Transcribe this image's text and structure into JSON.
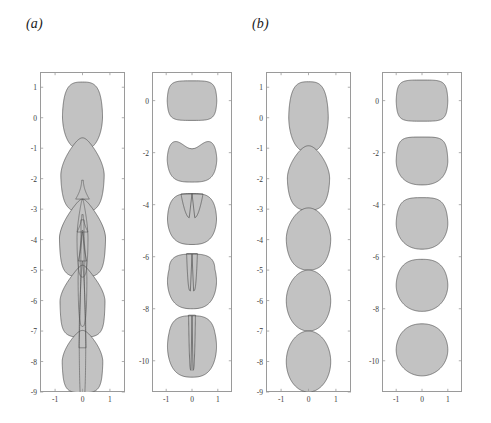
{
  "figure": {
    "background": "#ffffff",
    "shape_fill": "#c2c2c2",
    "shape_stroke": "#4d4d4d",
    "axis_color": "#9a9a9a",
    "tick_label_color": "#3a3a3a"
  },
  "panels": [
    {
      "label": "(a)",
      "subplots": [
        {
          "name": "panel-a-left",
          "xlim": [
            -1.55,
            1.55
          ],
          "ylim": [
            -9.0,
            1.5
          ],
          "xticks": [
            -1,
            0,
            1
          ],
          "xticklabels": [
            "-1",
            "0",
            "1"
          ],
          "yticks": [
            1,
            0,
            -1,
            -2,
            -3,
            -4,
            -5,
            -6,
            -7,
            -8,
            -9
          ],
          "yticklabels": [
            "1",
            "0",
            "-1",
            "-2",
            "-3",
            "-4",
            "-5",
            "-6",
            "-7",
            "-8",
            "-9"
          ],
          "has_interior_contours": true,
          "shape_count": 5
        },
        {
          "name": "panel-a-right",
          "xlim": [
            -1.55,
            1.55
          ],
          "ylim": [
            -11.2,
            1.1
          ],
          "xticks": [
            -1,
            0,
            1
          ],
          "xticklabels": [
            "-1",
            "0",
            "1"
          ],
          "yticks": [
            0,
            -2,
            -4,
            -6,
            -8,
            -10
          ],
          "yticklabels": [
            "0",
            "-2",
            "-4",
            "-6",
            "-8",
            "-10"
          ],
          "has_interior_contours": false,
          "shape_count": 5
        }
      ]
    },
    {
      "label": "(b)",
      "subplots": [
        {
          "name": "panel-b-left",
          "xlim": [
            -1.55,
            1.55
          ],
          "ylim": [
            -9.0,
            1.5
          ],
          "xticks": [
            -1,
            0,
            1
          ],
          "xticklabels": [
            "-1",
            "0",
            "1"
          ],
          "yticks": [
            1,
            0,
            -1,
            -2,
            -3,
            -4,
            -5,
            -6,
            -7,
            -8,
            -9
          ],
          "yticklabels": [
            "1",
            "0",
            "-1",
            "-2",
            "-3",
            "-4",
            "-5",
            "-6",
            "-7",
            "-8",
            "-9"
          ],
          "has_interior_contours": false,
          "shape_count": 5
        },
        {
          "name": "panel-b-right",
          "xlim": [
            -1.55,
            1.55
          ],
          "ylim": [
            -11.2,
            1.1
          ],
          "xticks": [
            -1,
            0,
            1
          ],
          "xticklabels": [
            "-1",
            "0",
            "1"
          ],
          "yticks": [
            0,
            -2,
            -4,
            -6,
            -8,
            -10
          ],
          "yticklabels": [
            "0",
            "-2",
            "-4",
            "-6",
            "-8",
            "-10"
          ],
          "has_interior_contours": false,
          "shape_count": 5
        }
      ]
    }
  ],
  "chart_data": {
    "type": "line",
    "title": "",
    "xlabel": "",
    "ylabel": "",
    "subplots": [
      {
        "id": "panel-a-left",
        "type": "line",
        "xlim": [
          -1.55,
          1.55
        ],
        "ylim": [
          -9.0,
          1.5
        ],
        "xticks": [
          -1,
          0,
          1
        ],
        "yticks": [
          1,
          0,
          -1,
          -2,
          -3,
          -4,
          -5,
          -6,
          -7,
          -8,
          -9
        ],
        "grid": false,
        "legend": "none",
        "series": [
          {
            "name": "t1-ellipse",
            "center_y": 0.1,
            "half_width": 0.72,
            "half_height": 1.1,
            "filled": true,
            "note": "near-spherical cap, widest at y~0"
          },
          {
            "name": "t2-pear",
            "center_y": -1.9,
            "half_width": 0.78,
            "half_height": 1.2,
            "filled": true,
            "note": "pear shaped, pointed top at y~-0.65"
          },
          {
            "name": "t3-tailed",
            "center_y": -3.9,
            "half_width": 0.82,
            "half_height": 1.25,
            "filled": true,
            "note": "rounded lobe with thin tail reaching y~-2.05"
          },
          {
            "name": "t4-necked",
            "center_y": -6.0,
            "half_width": 0.8,
            "half_height": 1.15,
            "filled": true,
            "note": "lobe with long thin jet up to y~-3.15"
          },
          {
            "name": "t5-detached",
            "center_y": -8.0,
            "half_width": 0.72,
            "half_height": 1.0,
            "filled": true,
            "note": "nearly spherical drop with residual thin filament"
          }
        ]
      },
      {
        "id": "panel-a-right",
        "type": "line",
        "xlim": [
          -1.55,
          1.55
        ],
        "ylim": [
          -11.2,
          1.1
        ],
        "xticks": [
          -1,
          0,
          1
        ],
        "yticks": [
          0,
          -2,
          -4,
          -6,
          -8,
          -10
        ],
        "grid": false,
        "legend": "none",
        "series": [
          {
            "name": "snap-1",
            "center_y": 0.0,
            "half_width": 0.95,
            "half_height": 0.75,
            "shape": "oblate-ellipse"
          },
          {
            "name": "snap-2",
            "center_y": -2.2,
            "half_width": 0.95,
            "half_height": 0.85,
            "shape": "dimpled-top"
          },
          {
            "name": "snap-3",
            "center_y": -4.5,
            "half_width": 0.95,
            "half_height": 0.95,
            "shape": "u-cup"
          },
          {
            "name": "snap-4",
            "center_y": -6.9,
            "half_width": 0.95,
            "half_height": 1.0,
            "shape": "deep-cleft"
          },
          {
            "name": "snap-5",
            "center_y": -9.4,
            "half_width": 0.95,
            "half_height": 1.1,
            "shape": "long-slit-toroid"
          }
        ]
      },
      {
        "id": "panel-b-left",
        "type": "line",
        "xlim": [
          -1.55,
          1.55
        ],
        "ylim": [
          -9.0,
          1.5
        ],
        "xticks": [
          -1,
          0,
          1
        ],
        "yticks": [
          1,
          0,
          -1,
          -2,
          -3,
          -4,
          -5,
          -6,
          -7,
          -8,
          -9
        ],
        "grid": false,
        "legend": "none",
        "series": [
          {
            "name": "t1-prolate",
            "center_y": 0.05,
            "half_width": 0.72,
            "half_height": 1.15,
            "filled": true
          },
          {
            "name": "t2-egg",
            "center_y": -2.0,
            "half_width": 0.76,
            "half_height": 1.05,
            "filled": true
          },
          {
            "name": "t3-round",
            "center_y": -4.0,
            "half_width": 0.8,
            "half_height": 1.0,
            "filled": true
          },
          {
            "name": "t4-round",
            "center_y": -6.0,
            "half_width": 0.8,
            "half_height": 1.0,
            "filled": true
          },
          {
            "name": "t5-round",
            "center_y": -8.0,
            "half_width": 0.8,
            "half_height": 1.0,
            "filled": true
          }
        ]
      },
      {
        "id": "panel-b-right",
        "type": "line",
        "xlim": [
          -1.55,
          1.55
        ],
        "ylim": [
          -11.2,
          1.1
        ],
        "xticks": [
          -1,
          0,
          1
        ],
        "yticks": [
          0,
          -2,
          -4,
          -6,
          -8,
          -10
        ],
        "grid": false,
        "legend": "none",
        "series": [
          {
            "name": "snap-1",
            "center_y": 0.0,
            "half_width": 1.0,
            "half_height": 0.78,
            "shape": "oblate-ellipse"
          },
          {
            "name": "snap-2",
            "center_y": -2.3,
            "half_width": 1.0,
            "half_height": 0.9,
            "shape": "flat-top-round"
          },
          {
            "name": "snap-3",
            "center_y": -4.7,
            "half_width": 1.0,
            "half_height": 0.98,
            "shape": "round"
          },
          {
            "name": "snap-4",
            "center_y": -7.1,
            "half_width": 1.0,
            "half_height": 1.0,
            "shape": "round"
          },
          {
            "name": "snap-5",
            "center_y": -9.6,
            "half_width": 1.0,
            "half_height": 1.0,
            "shape": "round"
          }
        ]
      }
    ]
  }
}
